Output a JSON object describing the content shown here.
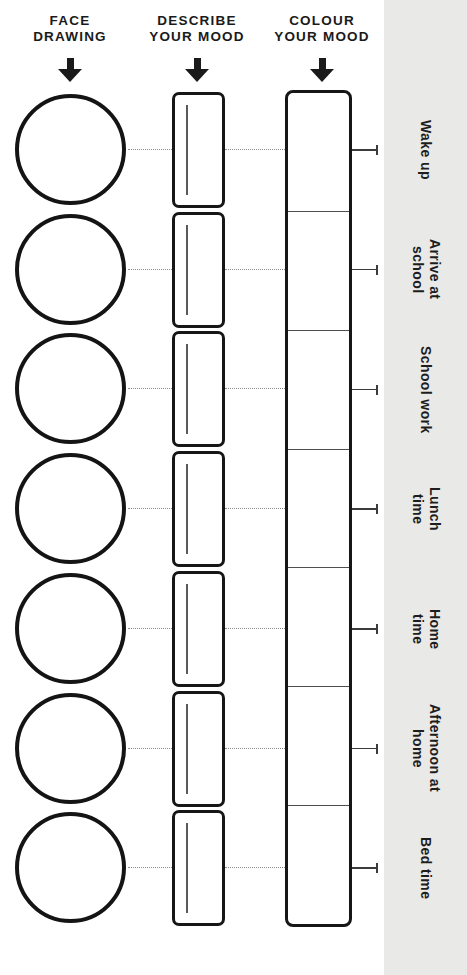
{
  "colors": {
    "ink": "#1a1a1a",
    "band": "#e9e9e8",
    "writeline": "#5a5a5a",
    "dotted": "#8c8c8c",
    "lead": "#3c3c3c",
    "divider": "#4f4f4f"
  },
  "columns": [
    {
      "label": "FACE\nDRAWING",
      "icon": "down-arrow"
    },
    {
      "label": "DESCRIBE\nYOUR MOOD",
      "icon": "down-arrow"
    },
    {
      "label": "COLOUR\nYOUR MOOD",
      "icon": "down-arrow"
    }
  ],
  "rows": [
    {
      "label": "Wake up"
    },
    {
      "label": "Arrive at\nschool"
    },
    {
      "label": "School work"
    },
    {
      "label": "Lunch\ntime"
    },
    {
      "label": "Home\ntime"
    },
    {
      "label": "Afternoon at\nhome"
    },
    {
      "label": "Bed time"
    }
  ]
}
